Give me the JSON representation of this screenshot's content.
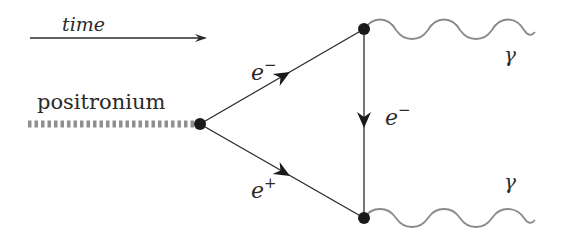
{
  "diagram": {
    "type": "feynman-diagram",
    "labels": {
      "time": "time",
      "positronium": "positronium",
      "electron_upper": "e",
      "electron_upper_sup": "−",
      "positron": "e",
      "positron_sup": "+",
      "electron_vertical": "e",
      "electron_vertical_sup": "−",
      "photon_top": "γ",
      "photon_bottom": "γ"
    },
    "vertices": [
      {
        "id": "left",
        "x": 200,
        "y": 124
      },
      {
        "id": "top-right",
        "x": 364,
        "y": 29
      },
      {
        "id": "bottom-right",
        "x": 364,
        "y": 218
      }
    ],
    "edges": [
      {
        "from": "positronium-source",
        "to": "left",
        "kind": "positronium (dashed)"
      },
      {
        "from": "left",
        "to": "top-right",
        "kind": "fermion",
        "particle": "e−"
      },
      {
        "from": "left",
        "to": "bottom-right",
        "kind": "fermion",
        "particle": "e+"
      },
      {
        "from": "top-right",
        "to": "bottom-right",
        "kind": "fermion",
        "particle": "e−"
      },
      {
        "from": "top-right",
        "to": "out",
        "kind": "photon",
        "particle": "γ"
      },
      {
        "from": "bottom-right",
        "to": "out",
        "kind": "photon",
        "particle": "γ"
      }
    ],
    "colors": {
      "line": "#2a2a2a",
      "photon": "#8a8a8a",
      "positronium_dash": "#8f8f8f",
      "vertex": "#1a1a1a"
    }
  }
}
